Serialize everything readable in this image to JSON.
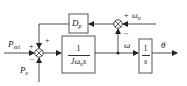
{
  "diagram": {
    "type": "block-diagram",
    "colors": {
      "line": "#333333",
      "box_border": "#444444",
      "box_fill": "#ffffff",
      "text": "#222222"
    },
    "inputs": {
      "p_set": {
        "base": "P",
        "sub": "set"
      },
      "p_e": {
        "base": "P",
        "sub": "e"
      },
      "omega_n": {
        "base": "ω",
        "sub": "n"
      }
    },
    "summing_junctions": [
      {
        "id": "sum-power",
        "signs": {
          "left": "+",
          "top": "+",
          "bottom": "−"
        }
      },
      {
        "id": "sum-speed",
        "signs": {
          "right": "+",
          "bottom": "−"
        }
      }
    ],
    "blocks": {
      "damping": {
        "base": "D",
        "sub": "p"
      },
      "inertia": {
        "numerator": "1",
        "denominator_prefix": "Jω",
        "denominator_sub": "n",
        "denominator_suffix": "s"
      },
      "integrator": {
        "numerator": "1",
        "denominator": "s"
      }
    },
    "signals": {
      "omega": "ω",
      "theta": "θ"
    }
  }
}
